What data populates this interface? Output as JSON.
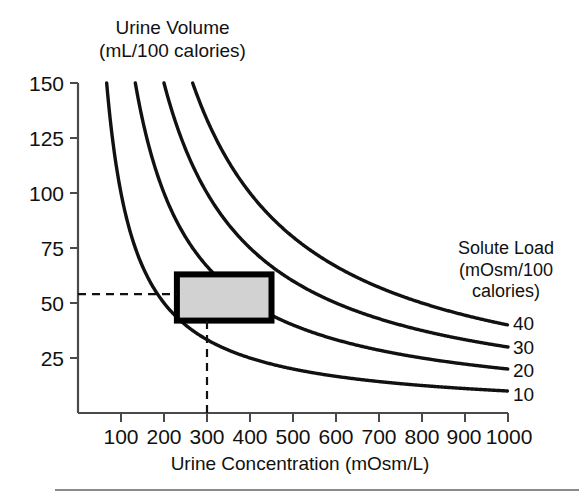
{
  "figure": {
    "y_axis_title": "Urine Volume\n(mL/100 calories)",
    "x_axis_title": "Urine Concentration (mOsm/L)",
    "legend_title": "Solute Load\n(mOsm/100\ncalories)"
  },
  "chart_data": {
    "type": "line",
    "title": "",
    "xlabel": "Urine Concentration (mOsm/L)",
    "ylabel": "Urine Volume (mL/100 calories)",
    "xlim": [
      0,
      1000
    ],
    "ylim": [
      0,
      150
    ],
    "xticks": [
      100,
      200,
      300,
      400,
      500,
      600,
      700,
      800,
      900,
      1000
    ],
    "yticks": [
      25,
      50,
      75,
      100,
      125,
      150
    ],
    "xtick_labels": [
      "100",
      "200",
      "300",
      "400",
      "500",
      "600",
      "700",
      "800",
      "900",
      "1000"
    ],
    "ytick_labels": [
      "25",
      "50",
      "75",
      "100",
      "125",
      "150"
    ],
    "grid": false,
    "legend_position": "right",
    "legend_title": "Solute Load (mOsm/100 calories)",
    "relation": "urine_volume = solute_load * 1000 / urine_concentration",
    "series": [
      {
        "name": "10",
        "label": "10",
        "solute_load": 10,
        "x": [
          67,
          100,
          150,
          200,
          250,
          300,
          400,
          500,
          600,
          700,
          800,
          900,
          1000
        ],
        "values": [
          150,
          100,
          66.7,
          50,
          40,
          33.3,
          25,
          20,
          16.7,
          14.3,
          12.5,
          11.1,
          10
        ]
      },
      {
        "name": "20",
        "label": "20",
        "solute_load": 20,
        "x": [
          133,
          150,
          200,
          250,
          300,
          400,
          500,
          600,
          700,
          800,
          900,
          1000
        ],
        "values": [
          150,
          133.3,
          100,
          80,
          66.7,
          50,
          40,
          33.3,
          28.6,
          25,
          22.2,
          20
        ]
      },
      {
        "name": "30",
        "label": "30",
        "solute_load": 30,
        "x": [
          200,
          250,
          300,
          400,
          500,
          600,
          700,
          800,
          900,
          1000
        ],
        "values": [
          150,
          120,
          100,
          75,
          60,
          50,
          42.9,
          37.5,
          33.3,
          30
        ]
      },
      {
        "name": "40",
        "label": "40",
        "solute_load": 40,
        "x": [
          267,
          300,
          400,
          500,
          600,
          700,
          800,
          900,
          1000
        ],
        "values": [
          150,
          133.3,
          100,
          80,
          66.7,
          57.1,
          50,
          44.4,
          40
        ]
      }
    ],
    "annotations": [
      {
        "name": "normal-range-box",
        "type": "rect",
        "x_range": [
          230,
          450
        ],
        "y_range": [
          42,
          63
        ],
        "fill": "#d2d2d2",
        "stroke": "#000000"
      },
      {
        "name": "horizontal-reference-line",
        "type": "dashed-hline",
        "y": 54,
        "x_from": 0,
        "x_to": 230
      },
      {
        "name": "vertical-reference-line",
        "type": "dashed-vline",
        "x": 300,
        "y_from": 0,
        "y_to": 42
      }
    ],
    "curve_labels": [
      "40",
      "30",
      "20",
      "10"
    ]
  },
  "colors": {
    "curve": "#111111",
    "axis": "#4a4a4a",
    "box_fill": "#d2d2d2",
    "box_stroke": "#000000",
    "rule": "#8a8a8a",
    "text": "#111111"
  }
}
